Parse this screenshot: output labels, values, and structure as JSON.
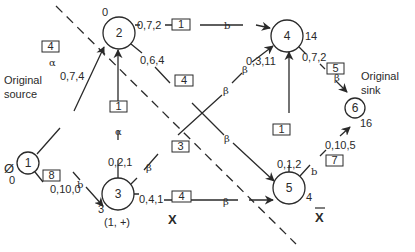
{
  "diagram": {
    "type": "network-flow",
    "nodes": [
      {
        "id": "1",
        "label": "1",
        "x": 28,
        "y": 163,
        "r": 12,
        "potential": "0",
        "mark": "Ø",
        "caption_lines": [
          "Original",
          "source"
        ]
      },
      {
        "id": "2",
        "label": "2",
        "x": 119,
        "y": 33,
        "r": 16,
        "potential": "0"
      },
      {
        "id": "3",
        "label": "3",
        "x": 118,
        "y": 194,
        "r": 16,
        "potential": "3",
        "node_label": "(1, +)"
      },
      {
        "id": "4",
        "label": "4",
        "x": 287,
        "y": 36,
        "r": 16,
        "potential": "14"
      },
      {
        "id": "5",
        "label": "5",
        "x": 289,
        "y": 188,
        "r": 16,
        "potential": "4"
      },
      {
        "id": "6",
        "label": "6",
        "x": 354,
        "y": 161,
        "r": 10,
        "potential": "16",
        "caption_lines": [
          "Original",
          "sink"
        ]
      }
    ],
    "edges": [
      {
        "from": "1",
        "to": "2",
        "triple": "0,7,4",
        "box": "4",
        "state": "α"
      },
      {
        "from": "1",
        "to": "3",
        "triple": "0,10,0",
        "box": "8",
        "state": "b"
      },
      {
        "from": "3",
        "to": "2",
        "triple": "0,2,1",
        "box": "1",
        "state": "α"
      },
      {
        "from": "2",
        "to": "4",
        "triple": "0,7,2",
        "box": "1",
        "state": "b"
      },
      {
        "from": "2",
        "to": "5",
        "triple": "0,6,4",
        "box": "4",
        "state": "β"
      },
      {
        "from": "3",
        "to": "4",
        "triple": "0,3,11",
        "box": "3",
        "state": "β"
      },
      {
        "from": "3",
        "to": "5",
        "triple": "0,4,1",
        "box": "4",
        "state": "β"
      },
      {
        "from": "5",
        "to": "4",
        "triple": "0,1,2",
        "box": "1",
        "state": ""
      },
      {
        "from": "4",
        "to": "6",
        "triple": "0,7,2",
        "box": "5",
        "state": "β"
      },
      {
        "from": "5",
        "to": "6",
        "triple": "0,10,5",
        "box": "7",
        "state": "b"
      }
    ],
    "cut": {
      "set_label": "X",
      "complement_label": "X̄"
    }
  },
  "labels": {
    "n1": "1",
    "n2": "2",
    "n3": "3",
    "n4": "4",
    "n5": "5",
    "n6": "6",
    "pot1": "0",
    "pot2": "0",
    "pot3": "3",
    "pot4": "14",
    "pot5": "4",
    "pot6": "16",
    "mark1": "Ø",
    "node3_label": "(1, +)",
    "source_line1": "Original",
    "source_line2": "source",
    "sink_line1": "Original",
    "sink_line2": "sink",
    "e12_triple": "0,7,4",
    "e12_box": "4",
    "e12_state": "α",
    "e13_triple": "0,10,0",
    "e13_box": "8",
    "e13_state": "b",
    "e32_triple": "0,2,1",
    "e32_box": "1",
    "e32_state": "α",
    "e24_triple": "0,7,2",
    "e24_box": "1",
    "e24_state": "b",
    "e25_triple": "0,6,4",
    "e25_box": "4",
    "e25_state": "β",
    "e34_triple": "0,3,11",
    "e34_box": "3",
    "e34_state": "β",
    "e35_triple": "0,4,1",
    "e35_box": "4",
    "e35_state": "β",
    "e54_triple": "0,1,2",
    "e54_box": "1",
    "e46_triple": "0,7,2",
    "e46_box": "5",
    "e46_state": "β",
    "e56_triple": "0,10,5",
    "e56_box": "7",
    "e56_state": "b",
    "cut_x": "X",
    "cut_xbar": "X"
  },
  "colors": {
    "stroke": "#2a2a2a",
    "background": "#ffffff"
  }
}
